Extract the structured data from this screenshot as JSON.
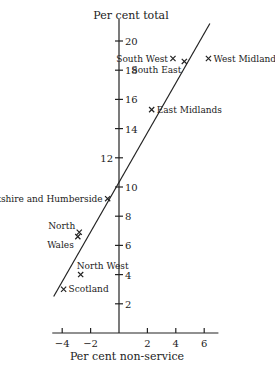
{
  "chart_data": {
    "type": "scatter",
    "title": "",
    "xlabel": "Per cent non-service",
    "ylabel": "Per cent total",
    "xlim": [
      -4.7,
      7
    ],
    "ylim": [
      0,
      21.5
    ],
    "x_ticks": [
      -4,
      -2,
      2,
      4,
      6
    ],
    "x_tick_labels": [
      "−4",
      "−2",
      "2",
      "4",
      "6"
    ],
    "y_ticks": [
      2,
      4,
      6,
      8,
      10,
      12,
      14,
      16,
      18,
      20
    ],
    "y_tick_labels": [
      "2",
      "4",
      "6",
      "8",
      "10",
      "12",
      "14",
      "16",
      "18",
      "20"
    ],
    "grid": false,
    "marker": "x",
    "points": [
      {
        "label": "South West",
        "x": 3.8,
        "y": 18.8,
        "label_pos": "left"
      },
      {
        "label": "South East",
        "x": 4.6,
        "y": 18.6,
        "label_pos": "below-left"
      },
      {
        "label": "West Midlands",
        "x": 6.3,
        "y": 18.8,
        "label_pos": "right"
      },
      {
        "label": "East Midlands",
        "x": 2.3,
        "y": 15.3,
        "label_pos": "right"
      },
      {
        "label": "Yorkshire and Humberside",
        "x": -0.8,
        "y": 9.2,
        "label_pos": "left"
      },
      {
        "label": "North",
        "x": -2.8,
        "y": 6.9,
        "label_pos": "upper-left"
      },
      {
        "label": "Wales",
        "x": -2.9,
        "y": 6.6,
        "label_pos": "lower-left"
      },
      {
        "label": "North West",
        "x": -2.7,
        "y": 4.0,
        "label_pos": "above"
      },
      {
        "label": "Scotland",
        "x": -3.9,
        "y": 3.0,
        "label_pos": "right"
      }
    ],
    "regression_line": {
      "x1": -4.6,
      "y1": 2.5,
      "x2": 6.4,
      "y2": 21.2
    }
  }
}
